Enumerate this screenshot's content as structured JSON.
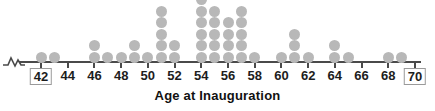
{
  "chart_data": {
    "type": "dotplot",
    "title": "Age at Inauguration",
    "xlabel": "Age at Inauguration",
    "ylabel": "",
    "grid": false,
    "legend": null,
    "xlim": [
      41,
      70
    ],
    "axis_break": "left",
    "tick_step": 2,
    "tick_labels": [
      "42",
      "44",
      "46",
      "48",
      "50",
      "52",
      "54",
      "56",
      "58",
      "60",
      "62",
      "64",
      "66",
      "68",
      "70"
    ],
    "boxed_tick_labels": [
      "42",
      "70"
    ],
    "dot_color": "#b8b8b8",
    "axis_color": "#4a4a4a",
    "categories": [
      42,
      43,
      44,
      45,
      46,
      47,
      48,
      49,
      50,
      51,
      52,
      53,
      54,
      55,
      56,
      57,
      58,
      59,
      60,
      61,
      62,
      63,
      64,
      65,
      66,
      67,
      68,
      69
    ],
    "values": [
      1,
      1,
      0,
      0,
      2,
      1,
      1,
      2,
      1,
      5,
      2,
      0,
      6,
      5,
      4,
      5,
      1,
      0,
      1,
      3,
      1,
      0,
      2,
      1,
      0,
      0,
      1,
      1
    ]
  },
  "title": {
    "text": "Age at Inauguration"
  }
}
